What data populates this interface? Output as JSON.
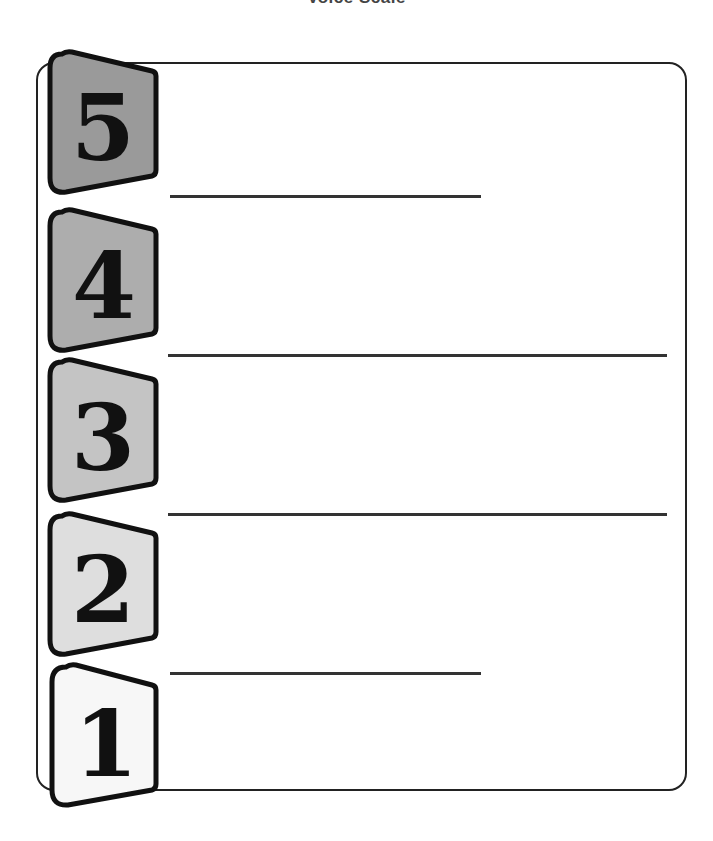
{
  "title": "Voice Scale",
  "scale": {
    "levels": [
      {
        "number": "5",
        "fill": "#9a9a9a",
        "line_width": "short"
      },
      {
        "number": "4",
        "fill": "#adadad",
        "line_width": "long"
      },
      {
        "number": "3",
        "fill": "#c4c4c4",
        "line_width": "long"
      },
      {
        "number": "2",
        "fill": "#dedede",
        "line_width": "short"
      },
      {
        "number": "1",
        "fill": "#f7f7f7",
        "line_width": "none"
      }
    ]
  }
}
